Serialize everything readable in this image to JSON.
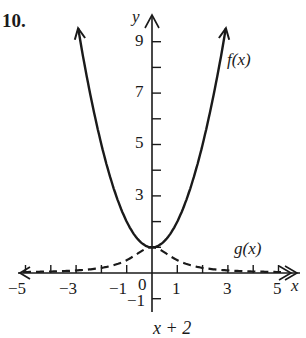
{
  "problem": {
    "number": "10.",
    "top_fragment": "",
    "bottom_fragment": "x + 2"
  },
  "chart_data": {
    "type": "line",
    "title": "",
    "xlabel": "x",
    "ylabel": "y",
    "xlim": [
      -5.2,
      5.4
    ],
    "ylim": [
      -1.3,
      9.6
    ],
    "grid": false,
    "x_ticks": [
      -5,
      -4,
      -3,
      -2,
      -1,
      1,
      2,
      3,
      4,
      5
    ],
    "x_tick_labels": [
      "−5",
      "−3",
      "−1",
      "0",
      "1",
      "3",
      "5"
    ],
    "y_ticks": [
      -1,
      1,
      2,
      3,
      4,
      5,
      6,
      7,
      8,
      9
    ],
    "y_tick_labels": [
      "9",
      "7",
      "5",
      "3",
      "−1"
    ],
    "series": [
      {
        "name": "f(x)",
        "label": "f(x)",
        "style": "solid",
        "formula": "x^2 + 1",
        "x": [
          -2.9,
          -2,
          -1,
          0,
          1,
          2,
          2.9
        ],
        "values": [
          9.41,
          5,
          2,
          1,
          2,
          5,
          9.41
        ]
      },
      {
        "name": "g(x)",
        "label": "g(x)",
        "style": "dashed",
        "formula": "1 / (x^2 + 1)",
        "x": [
          -5,
          -3,
          -2,
          -1,
          0,
          1,
          2,
          3,
          5
        ],
        "values": [
          0.04,
          0.1,
          0.2,
          0.5,
          1,
          0.5,
          0.2,
          0.1,
          0.04
        ]
      }
    ],
    "annotations": [
      "f(x)",
      "g(x)"
    ]
  },
  "labels": {
    "x_axis": "x",
    "y_axis": "y",
    "f": "f(x)",
    "g": "g(x)",
    "xt_m5": "−5",
    "xt_m3": "−3",
    "xt_m1": "−1",
    "xt_0": "0",
    "xt_1": "1",
    "xt_3": "3",
    "xt_5": "5",
    "yt_9": "9",
    "yt_7": "7",
    "yt_5": "5",
    "yt_3": "3",
    "yt_m1": "−1"
  },
  "colors": {
    "ink": "#1a1a1a",
    "background": "#ffffff"
  }
}
